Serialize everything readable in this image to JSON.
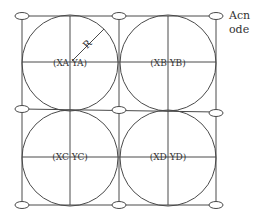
{
  "diagram": {
    "type": "circle-grid-layout",
    "grid": {
      "columns": 2,
      "rows": 2,
      "vertical_lines_x": [
        22,
        119,
        216
      ],
      "horizontal_lines_y": [
        16,
        110,
        205
      ]
    },
    "circles": [
      {
        "id": "A",
        "label": "(XA YA)",
        "cx": 70,
        "cy": 63,
        "r": 48
      },
      {
        "id": "B",
        "label": "(XB YB)",
        "cx": 168,
        "cy": 63,
        "r": 48
      },
      {
        "id": "C",
        "label": "(XC YC)",
        "cx": 70,
        "cy": 158,
        "r": 48
      },
      {
        "id": "D",
        "label": "(XD YD)",
        "cx": 168,
        "cy": 158,
        "r": 48
      }
    ],
    "radius_label": "R",
    "node_label": {
      "line1": "Acn",
      "line2": "ode"
    },
    "colors": {
      "stroke": "#4a4a4a",
      "text": "#333333",
      "background": "#ffffff"
    }
  }
}
